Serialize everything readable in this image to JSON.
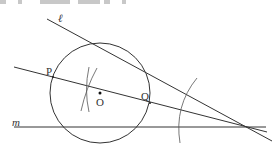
{
  "diagram": {
    "labels": {
      "line_l": "ℓ",
      "line_m": "m",
      "point_p": "P",
      "point_q": "Q",
      "point_o": "O"
    },
    "colors": {
      "stroke": "#333333",
      "arc": "#555555",
      "top_strip": "#c8c8c8"
    }
  }
}
